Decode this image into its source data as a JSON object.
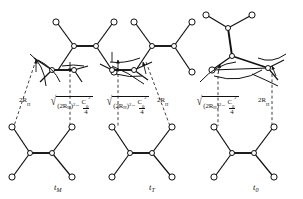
{
  "figure": {
    "background": "#ffffff",
    "stroke_color": "#111111",
    "node_fill": "#ffffff",
    "width": 303,
    "height": 199
  },
  "panels": [
    {
      "id": "panel-tm",
      "label": "t",
      "label_sub": "M",
      "label_x": 58,
      "label_y": 190,
      "left_measure": "2R",
      "left_measure_sub": "H",
      "right_measure_radicand_a": "(2R",
      "right_measure_radicand_a_sub": "H",
      "right_measure_radicand_a_tail": ")",
      "right_measure_exp": "2",
      "right_measure_minus": "−",
      "right_measure_frac_num": "C",
      "right_measure_frac_num_sub": "0",
      "right_measure_frac_num_exp": "2",
      "right_measure_frac_den": "4"
    },
    {
      "id": "panel-tt",
      "label": "t",
      "label_sub": "T",
      "label_x": 153,
      "label_y": 190
    },
    {
      "id": "panel-t0",
      "label": "t",
      "label_sub": "0",
      "label_x": 257,
      "label_y": 190
    }
  ],
  "measures": {
    "short_label_base": "2R",
    "short_label_sub": "H",
    "radical_open": "√",
    "radicand_term1_base": "(2R",
    "radicand_term1_sub": "H",
    "radicand_term1_close": ")",
    "radicand_term1_exp": "2",
    "operator": "−",
    "frac_num_base": "C",
    "frac_num_sub": "0",
    "frac_num_exp": "2",
    "frac_den": "4"
  },
  "labels": {
    "panel1_short": {
      "x": 20,
      "y": 101
    },
    "panel1_long": {
      "x": 50,
      "y": 92
    },
    "panel2_long": {
      "x": 106,
      "y": 92
    },
    "panel2_short": {
      "x": 158,
      "y": 101
    },
    "panel3_long": {
      "x": 196,
      "y": 92
    },
    "panel3_short": {
      "x": 259,
      "y": 101
    }
  },
  "legend_note": "Three rotational conformers with interatomic distance annotations"
}
